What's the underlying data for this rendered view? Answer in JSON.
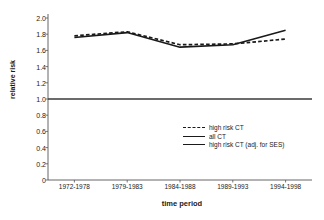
{
  "chart_data": {
    "type": "line",
    "title": "",
    "xlabel": "time period",
    "ylabel": "relative risk",
    "categories": [
      "1972-1978",
      "1979-1983",
      "1984-1988",
      "1989-1993",
      "1994-1998"
    ],
    "ylim": [
      0,
      2.0
    ],
    "yticks": [
      "0",
      "0.2",
      "0.4",
      "0.6",
      "0.8",
      "1.0",
      "1.2",
      "1.4",
      "1.6",
      "1.8",
      "2.0"
    ],
    "ytick_values": [
      0,
      0.2,
      0.4,
      0.6,
      0.8,
      1.0,
      1.2,
      1.4,
      1.6,
      1.8,
      2.0
    ],
    "grid": false,
    "legend_position": "inside-lower-right",
    "series": [
      {
        "name": "high risk CT",
        "style": "dashed",
        "color": "#1a1a1a",
        "values": [
          1.78,
          1.83,
          1.67,
          1.68,
          1.74
        ]
      },
      {
        "name": "all CT",
        "style": "solid",
        "color": "#1a1a1a",
        "values": [
          1.76,
          1.82,
          1.64,
          1.67,
          1.85
        ]
      },
      {
        "name": "high risk CT (adj. for SES)",
        "style": "solid",
        "color": "#3a3a3a",
        "values": [
          1.0,
          1.0,
          1.0,
          1.0,
          1.0
        ]
      }
    ]
  },
  "axes": {
    "y_title": "relative risk",
    "x_title": "time period"
  },
  "legend": {
    "items": [
      {
        "label": "high risk CT",
        "style": "dashed"
      },
      {
        "label": "all CT",
        "style": "solid"
      },
      {
        "label": "high risk CT (adj. for SES)",
        "style": "solid"
      }
    ]
  },
  "colors": {
    "ink": "#1a1a1a",
    "axis": "#555555",
    "background": "#ffffff"
  }
}
